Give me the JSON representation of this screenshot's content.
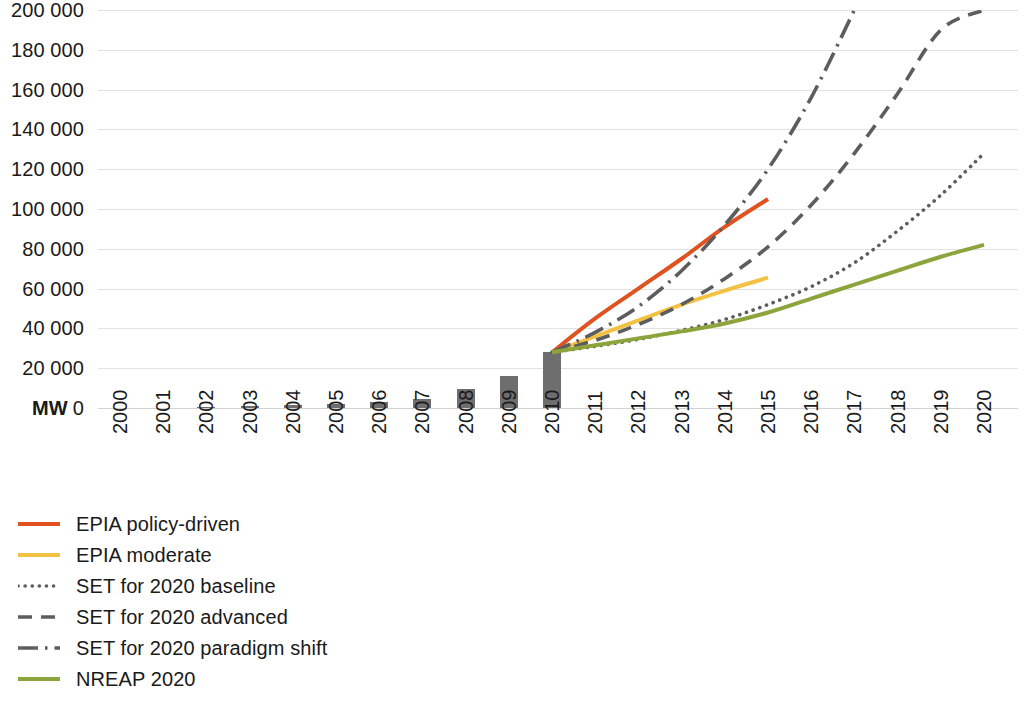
{
  "chart_data": {
    "type": "line",
    "title": "",
    "subtitle": "",
    "xlabel": "",
    "ylabel": "MW",
    "grid": true,
    "legend_position": "bottom-left",
    "xlim": [
      2000,
      2020
    ],
    "ylim": [
      0,
      200000
    ],
    "y_ticks": [
      {
        "value": 0,
        "unit": "MW",
        "label": "0"
      },
      {
        "value": 20000,
        "unit": "",
        "label": "20 000"
      },
      {
        "value": 40000,
        "unit": "",
        "label": "40 000"
      },
      {
        "value": 60000,
        "unit": "",
        "label": "60 000"
      },
      {
        "value": 80000,
        "unit": "",
        "label": "80 000"
      },
      {
        "value": 100000,
        "unit": "",
        "label": "100 000"
      },
      {
        "value": 120000,
        "unit": "",
        "label": "120 000"
      },
      {
        "value": 140000,
        "unit": "",
        "label": "140 000"
      },
      {
        "value": 160000,
        "unit": "",
        "label": "160 000"
      },
      {
        "value": 180000,
        "unit": "",
        "label": "180 000"
      },
      {
        "value": 200000,
        "unit": "",
        "label": "200 000"
      }
    ],
    "categories": [
      "2000",
      "2001",
      "2002",
      "2003",
      "2004",
      "2005",
      "2006",
      "2007",
      "2008",
      "2009",
      "2010",
      "2011",
      "2012",
      "2013",
      "2014",
      "2015",
      "2016",
      "2017",
      "2018",
      "2019",
      "2020"
    ],
    "bars": {
      "name": "Historic installed capacity",
      "color": "#6e6e6e",
      "x": [
        2000,
        2001,
        2002,
        2003,
        2004,
        2005,
        2006,
        2007,
        2008,
        2009,
        2010
      ],
      "values": [
        100,
        200,
        400,
        900,
        1300,
        2200,
        3000,
        4500,
        9500,
        16000,
        28000
      ]
    },
    "series": [
      {
        "name": "EPIA policy-driven",
        "color": "#e0521f",
        "style": "solid",
        "x": [
          2010,
          2011,
          2012,
          2013,
          2014,
          2015
        ],
        "values": [
          28000,
          45000,
          60000,
          75000,
          91000,
          105000
        ]
      },
      {
        "name": "EPIA moderate",
        "color": "#f4c243",
        "style": "solid",
        "x": [
          2010,
          2011,
          2012,
          2013,
          2014,
          2015
        ],
        "values": [
          28000,
          36000,
          44000,
          52000,
          59000,
          65500
        ]
      },
      {
        "name": "SET for 2020 baseline",
        "color": "#5d5d5d",
        "style": "dotted",
        "x": [
          2010,
          2011,
          2012,
          2013,
          2014,
          2015,
          2016,
          2017,
          2018,
          2019,
          2020
        ],
        "values": [
          28000,
          31000,
          34500,
          39000,
          44500,
          52000,
          61000,
          73000,
          89000,
          107000,
          128000
        ]
      },
      {
        "name": "SET for 2020 advanced",
        "color": "#5d5d5d",
        "style": "dashed",
        "x": [
          2010,
          2011,
          2012,
          2013,
          2014,
          2015,
          2016,
          2017,
          2018,
          2019,
          2020
        ],
        "values": [
          28000,
          34000,
          42000,
          52000,
          65000,
          81000,
          102000,
          128000,
          158000,
          190000,
          200000
        ]
      },
      {
        "name": "SET for 2020 paradigm shift",
        "color": "#5d5d5d",
        "style": "dash-dot",
        "x": [
          2010,
          2011,
          2012,
          2013,
          2014,
          2015,
          2016,
          2017
        ],
        "values": [
          28000,
          38000,
          51000,
          69000,
          92000,
          120000,
          156000,
          200000
        ]
      },
      {
        "name": "NREAP 2020",
        "color": "#8ca43c",
        "style": "solid",
        "x": [
          2010,
          2011,
          2012,
          2013,
          2014,
          2015,
          2016,
          2017,
          2018,
          2019,
          2020
        ],
        "values": [
          28000,
          31500,
          35000,
          38500,
          42500,
          48000,
          55000,
          62000,
          69000,
          76000,
          82000
        ]
      }
    ]
  },
  "legend": {
    "items": [
      {
        "label": "EPIA policy-driven",
        "color": "#e0521f",
        "style": "solid"
      },
      {
        "label": "EPIA moderate",
        "color": "#f4c243",
        "style": "solid"
      },
      {
        "label": "SET for 2020 baseline",
        "color": "#5d5d5d",
        "style": "dotted"
      },
      {
        "label": "SET for 2020 advanced",
        "color": "#5d5d5d",
        "style": "dashed"
      },
      {
        "label": "SET for 2020 paradigm shift",
        "color": "#5d5d5d",
        "style": "dash-dot"
      },
      {
        "label": "NREAP 2020",
        "color": "#8ca43c",
        "style": "solid"
      }
    ]
  },
  "colors": {
    "grid": "#e2e2e2",
    "bar": "#6e6e6e",
    "gray_series": "#5d5d5d",
    "background": "#ffffff",
    "text": "#1a1a1a"
  }
}
